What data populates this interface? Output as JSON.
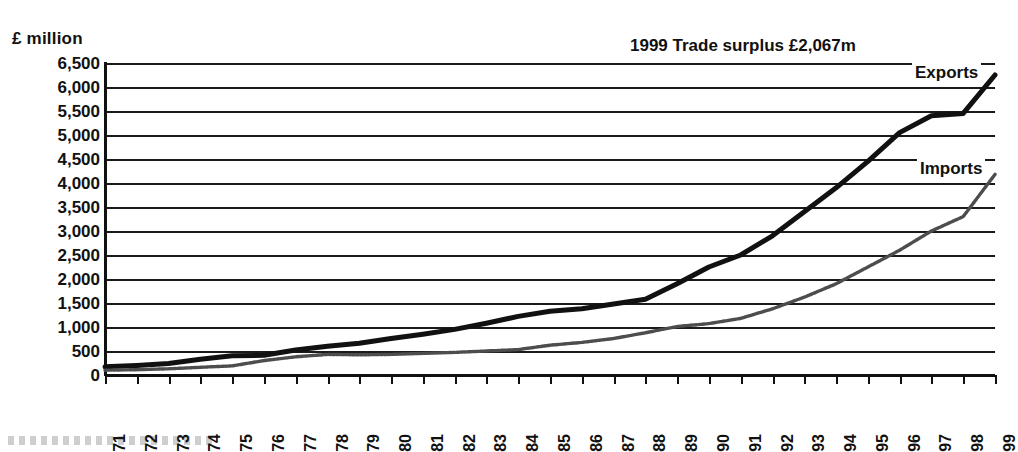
{
  "chart_data": {
    "type": "line",
    "title": "",
    "xlabel": "",
    "ylabel": "£ million",
    "ylim": [
      0,
      6500
    ],
    "ytick_step": 500,
    "grid": true,
    "legend_position": "inline-right",
    "x": [
      1971,
      1972,
      1973,
      1974,
      1975,
      1976,
      1977,
      1978,
      1979,
      1980,
      1981,
      1982,
      1983,
      1984,
      1985,
      1986,
      1987,
      1988,
      1989,
      1990,
      1991,
      1992,
      1993,
      1994,
      1995,
      1996,
      1997,
      1998,
      1999
    ],
    "categories": [
      "1971",
      "1972",
      "1973",
      "1974",
      "1975",
      "1976",
      "1977",
      "1978",
      "1979",
      "1980",
      "1981",
      "1982",
      "1983",
      "1984",
      "1985",
      "1986",
      "1987",
      "1988",
      "1989",
      "1990",
      "1991",
      "1992",
      "1993",
      "1994",
      "1995",
      "1996",
      "1997",
      "1998",
      "1999"
    ],
    "ytick_labels": [
      "6,500",
      "6,000",
      "5,500",
      "5,000",
      "4,500",
      "4,000",
      "3,500",
      "3,000",
      "2,500",
      "2,000",
      "1,500",
      "1,000",
      "500",
      "0"
    ],
    "ytick_values": [
      6500,
      6000,
      5500,
      5000,
      4500,
      4000,
      3500,
      3000,
      2500,
      2000,
      1500,
      1000,
      500,
      0
    ],
    "series": [
      {
        "name": "Exports",
        "color": "#111111",
        "values": [
          170,
          200,
          240,
          330,
          400,
          410,
          520,
          600,
          660,
          760,
          850,
          950,
          1080,
          1220,
          1330,
          1380,
          1480,
          1580,
          1900,
          2250,
          2500,
          2900,
          3400,
          3900,
          4450,
          5050,
          5400,
          5450,
          6250
        ]
      },
      {
        "name": "Imports",
        "color": "#555555",
        "values": [
          100,
          110,
          130,
          160,
          190,
          300,
          380,
          430,
          420,
          430,
          450,
          470,
          500,
          530,
          620,
          680,
          760,
          880,
          1010,
          1070,
          1180,
          1380,
          1620,
          1900,
          2250,
          2600,
          3000,
          3300,
          4180
        ]
      }
    ],
    "annotations": [
      {
        "id": "surplus",
        "text": "1999 Trade surplus £2,067m"
      },
      {
        "id": "exports_label",
        "text": "Exports"
      },
      {
        "id": "imports_label",
        "text": "Imports"
      }
    ]
  },
  "axis": {
    "y_unit_label": "£ million"
  },
  "legend": {
    "exports": "Exports",
    "imports": "Imports"
  },
  "annotation": {
    "surplus": "1999 Trade surplus £2,067m"
  }
}
